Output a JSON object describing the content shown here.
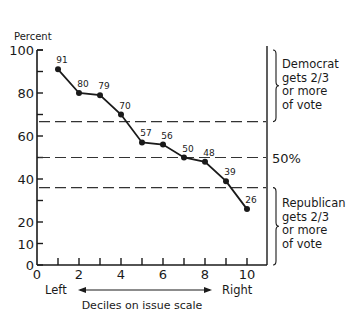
{
  "chart_data": {
    "type": "line",
    "title": "",
    "ylabel": "Percent",
    "xlabel": "Deciles on issue scale",
    "x_direction_labels": {
      "left": "Left",
      "right": "Right"
    },
    "x": [
      1,
      2,
      3,
      4,
      5,
      6,
      7,
      8,
      9,
      10
    ],
    "series": [
      {
        "name": "Democratic vote share",
        "values": [
          91,
          80,
          79,
          70,
          57,
          56,
          50,
          48,
          39,
          26
        ]
      }
    ],
    "point_labels": [
      "91",
      "80",
      "79",
      "70",
      "57",
      "56",
      "50",
      "48",
      "39",
      "26"
    ],
    "xlim": [
      0,
      10
    ],
    "ylim": [
      0,
      100
    ],
    "x_ticks": [
      0,
      1,
      2,
      3,
      4,
      5,
      6,
      7,
      8,
      9,
      10
    ],
    "x_tick_labels": [
      "0",
      "",
      "2",
      "",
      "4",
      "",
      "6",
      "",
      "8",
      "",
      "10"
    ],
    "y_ticks": [
      0,
      10,
      20,
      30,
      40,
      50,
      60,
      70,
      80,
      90,
      100
    ],
    "y_tick_labels": [
      "0",
      "10",
      "20",
      "",
      "40",
      "",
      "60",
      "",
      "80",
      "",
      "100"
    ],
    "grid": false,
    "legend": null,
    "reference_lines": [
      {
        "y": 66.7,
        "style": "dashed"
      },
      {
        "y": 50,
        "style": "dashed",
        "label": "50%"
      },
      {
        "y": 36,
        "style": "dashed"
      }
    ],
    "annotations": [
      {
        "text": [
          "Democrat",
          "gets 2/3",
          "or more",
          "of vote"
        ],
        "region": "above upper dashed line"
      },
      {
        "text": [
          "Republican",
          "gets 2/3",
          "or more",
          "of vote"
        ],
        "region": "below lower dashed line"
      }
    ]
  }
}
